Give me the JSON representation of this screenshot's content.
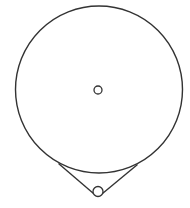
{
  "diagram": {
    "type": "pulley-belt",
    "stroke_color": "#333333",
    "background": "#ffffff",
    "large_circle": {
      "cx": 99,
      "cy": 89.5,
      "r": 83.5
    },
    "center_hole": {
      "cx": 98,
      "cy": 90,
      "r": 4
    },
    "small_circle": {
      "cx": 98,
      "cy": 191.5,
      "r": 5
    },
    "tangent_left": {
      "x1": 58.5,
      "y1": 163.5,
      "x2": 93.5,
      "y2": 193.5
    },
    "tangent_right": {
      "x1": 137.5,
      "y1": 164.5,
      "x2": 102.5,
      "y2": 193.5
    }
  }
}
